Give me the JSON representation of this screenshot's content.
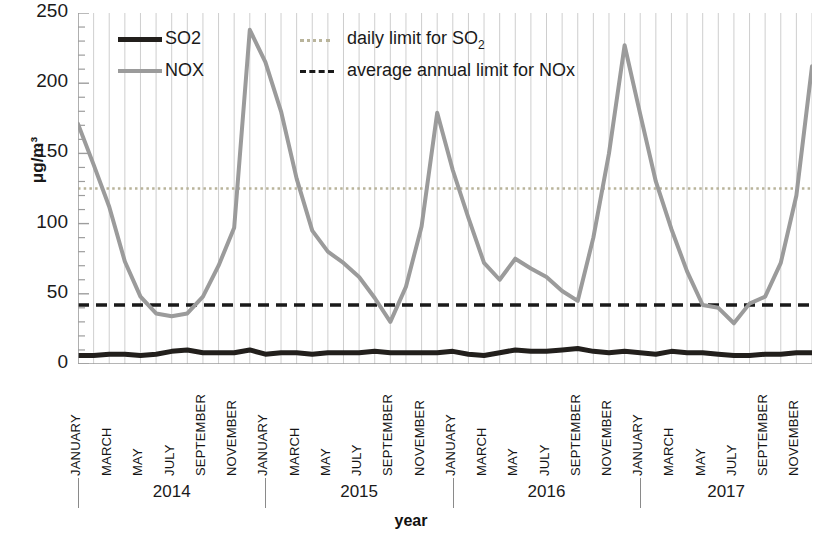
{
  "chart_data": {
    "type": "line",
    "title": "",
    "xlabel": "year",
    "ylabel": "μg/m³",
    "ylim": [
      0,
      250
    ],
    "ytick_values": [
      0,
      50,
      100,
      150,
      200,
      250
    ],
    "ytick_labels": [
      "0",
      "50",
      "100",
      "150",
      "200",
      "250"
    ],
    "minor_ticks": true,
    "grid": "vertical month gridlines",
    "legend_position": "top-left-inside",
    "x_group_labels": [
      "2014",
      "2015",
      "2016",
      "2017"
    ],
    "month_tick_labels": [
      "JANUARY",
      "MARCH",
      "MAY",
      "JULY",
      "SEPTEMBER",
      "NOVEMBER",
      "JANUARY",
      "MARCH",
      "MAY",
      "JULY",
      "SEPTEMBER",
      "NOVEMBER",
      "JANUARY",
      "MARCH",
      "MAY",
      "JULY",
      "SEPTEMBER",
      "NOVEMBER",
      "JANUARY",
      "MARCH",
      "MAY",
      "JULY",
      "SEPTEMBER",
      "NOVEMBER"
    ],
    "x": [
      "2014-01",
      "2014-02",
      "2014-03",
      "2014-04",
      "2014-05",
      "2014-06",
      "2014-07",
      "2014-08",
      "2014-09",
      "2014-10",
      "2014-11",
      "2014-12",
      "2015-01",
      "2015-02",
      "2015-03",
      "2015-04",
      "2015-05",
      "2015-06",
      "2015-07",
      "2015-08",
      "2015-09",
      "2015-10",
      "2015-11",
      "2015-12",
      "2016-01",
      "2016-02",
      "2016-03",
      "2016-04",
      "2016-05",
      "2016-06",
      "2016-07",
      "2016-08",
      "2016-09",
      "2016-10",
      "2016-11",
      "2016-12",
      "2017-01",
      "2017-02",
      "2017-03",
      "2017-04",
      "2017-05",
      "2017-06",
      "2017-07",
      "2017-08",
      "2017-09",
      "2017-10",
      "2017-11",
      "2017-12"
    ],
    "series": [
      {
        "name": "SO2",
        "color": "#221f1c",
        "style": "solid",
        "width": 5,
        "values": [
          6,
          6,
          7,
          7,
          6,
          7,
          9,
          10,
          8,
          8,
          8,
          10,
          7,
          8,
          8,
          7,
          8,
          8,
          8,
          9,
          8,
          8,
          8,
          8,
          9,
          7,
          6,
          8,
          10,
          9,
          9,
          10,
          11,
          9,
          8,
          9,
          8,
          7,
          9,
          8,
          8,
          7,
          6,
          6,
          7,
          7,
          8,
          8
        ]
      },
      {
        "name": "NOX",
        "color": "#9b9b9b",
        "style": "solid",
        "width": 4,
        "values": [
          171,
          142,
          112,
          73,
          48,
          36,
          34,
          36,
          48,
          70,
          97,
          238,
          215,
          180,
          132,
          95,
          80,
          72,
          62,
          47,
          30,
          55,
          98,
          179,
          138,
          104,
          72,
          60,
          75,
          68,
          62,
          52,
          45,
          90,
          150,
          227,
          178,
          130,
          96,
          66,
          42,
          40,
          29,
          43,
          48,
          72,
          120,
          212
        ]
      }
    ],
    "reference_lines": [
      {
        "name": "daily limit for SO2",
        "label": "daily limit for SO",
        "label_sub": "2",
        "value": 125,
        "style": "dotted",
        "color": "#b9b49b"
      },
      {
        "name": "average annual limit for NOx",
        "label": "average annual limit for NOx",
        "value": 42,
        "style": "dashed",
        "color": "#1a1a1a"
      }
    ],
    "legend": [
      {
        "label": "SO2",
        "style": "solid-thick",
        "color": "#221f1c"
      },
      {
        "label": "NOX",
        "style": "solid-thin",
        "color": "#9b9b9b"
      }
    ]
  }
}
